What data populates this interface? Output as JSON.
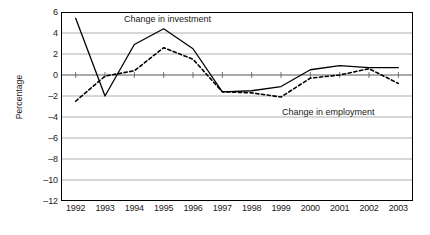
{
  "chart_data": {
    "type": "line",
    "title": "",
    "xlabel": "",
    "ylabel": "Percentage",
    "categories": [
      "1992",
      "1993",
      "1994",
      "1995",
      "1996",
      "1997",
      "1998",
      "1999",
      "2000",
      "2001",
      "2002",
      "2003"
    ],
    "x": [
      1992,
      1993,
      1994,
      1995,
      1996,
      1997,
      1998,
      1999,
      2000,
      2001,
      2002,
      2003
    ],
    "ylim": [
      -12,
      6
    ],
    "yticks": [
      6,
      4,
      2,
      0,
      -2,
      -4,
      -6,
      -8,
      -10,
      -12
    ],
    "ytick_labels": [
      "6",
      "4",
      "2",
      "0",
      "–2",
      "–4",
      "–6",
      "–8",
      "–10",
      "–12"
    ],
    "grid": true,
    "grid_axis": "y",
    "legend_position": "inline-annotations",
    "series": [
      {
        "name": "Change in investment",
        "style": "solid",
        "color": "#000000",
        "values": [
          5.4,
          -2.0,
          2.9,
          4.4,
          2.5,
          -1.6,
          -1.5,
          -1.1,
          0.5,
          0.9,
          0.7,
          0.7
        ]
      },
      {
        "name": "Change in employment",
        "style": "dashed",
        "color": "#000000",
        "values": [
          -2.5,
          -0.1,
          0.4,
          2.6,
          1.5,
          -1.6,
          -1.7,
          -2.1,
          -0.3,
          0.0,
          0.6,
          -0.8
        ]
      }
    ],
    "annotations": [
      {
        "text": "Change in investment",
        "series": "Change in investment"
      },
      {
        "text": "Change in employment",
        "series": "Change in employment"
      }
    ]
  }
}
